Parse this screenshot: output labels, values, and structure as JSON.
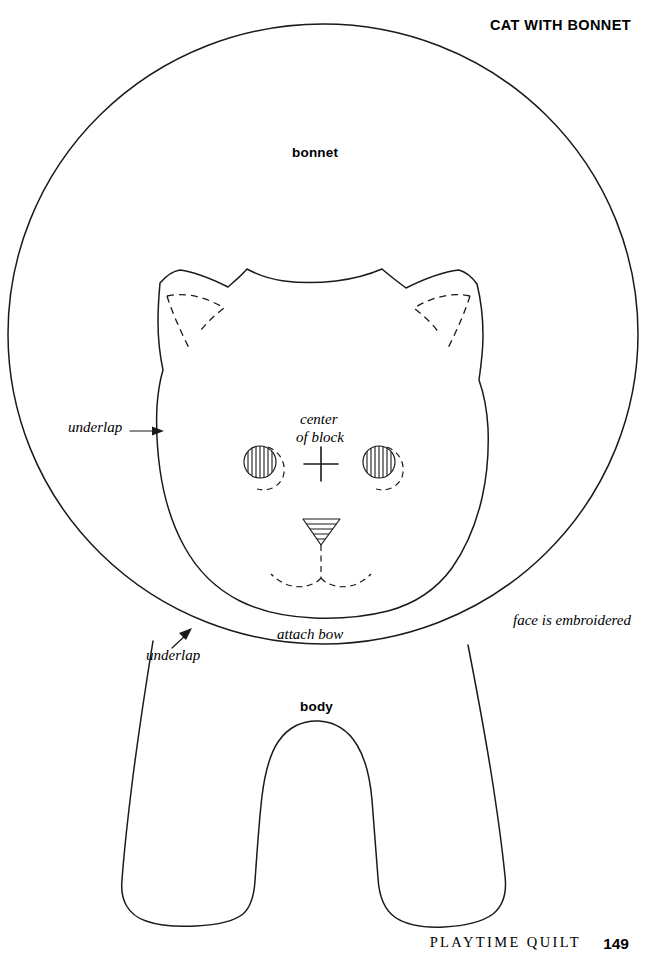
{
  "page": {
    "title": "CAT WITH BONNET",
    "width": 647,
    "height": 961,
    "background": "#ffffff",
    "ink_color": "#1a1a1a"
  },
  "footer": {
    "book_title": "PLAYTIME QUILT",
    "page_number": "149"
  },
  "labels": {
    "bonnet": "bonnet",
    "body": "body",
    "center_of_block_line1": "center",
    "center_of_block_line2": "of block",
    "underlap_left": "underlap",
    "underlap_lower": "underlap",
    "attach_bow": "attach bow",
    "face_note": "face is embroidered"
  },
  "pattern": {
    "kind": "sewing-pattern-template",
    "pieces": [
      {
        "name": "bonnet",
        "outline": "solid",
        "shape": "large circle"
      },
      {
        "name": "head",
        "outline": "solid",
        "shape": "rounded cat head with two ears"
      },
      {
        "name": "body",
        "outline": "solid",
        "shape": "tapered body with two legs"
      }
    ],
    "markings": [
      {
        "name": "center-of-block-cross",
        "style": "solid cross"
      },
      {
        "name": "left-inner-ear",
        "style": "dashed"
      },
      {
        "name": "right-inner-ear",
        "style": "dashed"
      },
      {
        "name": "left-eye",
        "style": "hatched circle with dashed arc"
      },
      {
        "name": "right-eye",
        "style": "hatched circle with dashed arc"
      },
      {
        "name": "nose",
        "style": "hatched inverted triangle"
      },
      {
        "name": "mouth",
        "style": "dashed stem with two dashed arcs"
      }
    ]
  }
}
